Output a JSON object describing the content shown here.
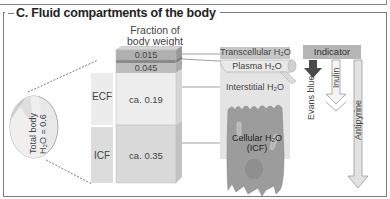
{
  "title": "C. Fluid compartments of the body",
  "fraction_header": [
    "Fraction of",
    "body weight"
  ],
  "circle": {
    "line1": "Total body",
    "line2": "H₂O = 0.6"
  },
  "side_labels": {
    "ecf": "ECF",
    "icf": "ICF"
  },
  "bar_segments": [
    {
      "label": "0.015",
      "compartment": "Transcellular H₂O",
      "color": "#b0b0b0"
    },
    {
      "label": "",
      "compartment": "",
      "color": "#8c8c8c"
    },
    {
      "label": "0.045",
      "compartment": "Plasma H₂O",
      "color": "#bdbdbd"
    },
    {
      "label": "ca. 0.19",
      "compartment": "Interstitial H₂O",
      "color": "#ececec"
    },
    {
      "label": "ca. 0.35",
      "compartment": "Cellular H₂O (ICF)",
      "color": "#d8d8d8"
    }
  ],
  "compartments": {
    "transcellular": "Transcellular H₂O",
    "plasma": "Plasma H₂O",
    "interstitial": "Interstitial H₂O",
    "cellular_line1": "Cellular H₂O",
    "cellular_line2": "(ICF)"
  },
  "indicator": {
    "header": "Indicator",
    "items": [
      {
        "name": "Evans blue",
        "style": "solid-dark"
      },
      {
        "name": "Inulin",
        "style": "outline"
      },
      {
        "name": "Antipyrine",
        "style": "light-long"
      }
    ]
  },
  "colors": {
    "frame": "#7a7a7a",
    "ecf_side": "#ececec",
    "icf_side": "#dcdcdc",
    "cell": "#9a9a9a",
    "indicator_header": "#b5b5b5",
    "evans_blue_arrow": "#4a4a4a"
  }
}
